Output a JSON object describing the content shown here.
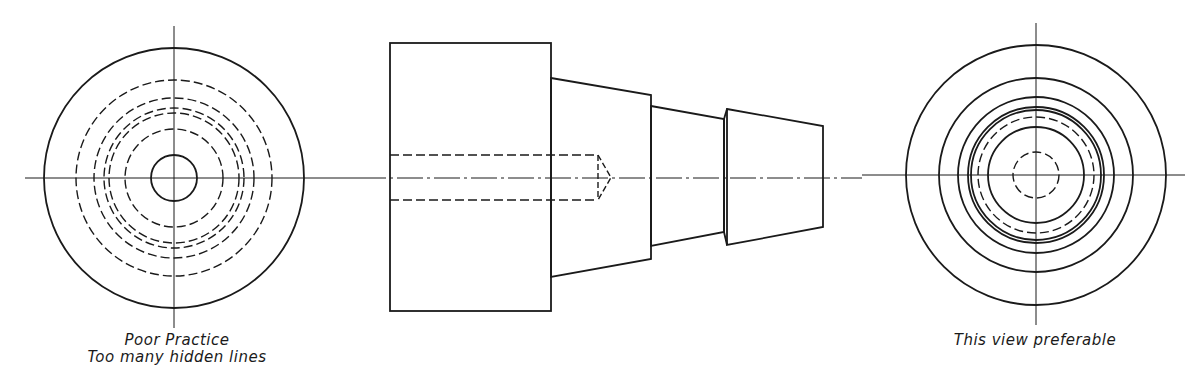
{
  "figure": {
    "colors": {
      "line": "#1a1a1a",
      "background": "#ffffff"
    },
    "views": [
      {
        "id": "left-end-view",
        "caption_lines": [
          "Poor Practice",
          "Too many hidden lines"
        ],
        "center": [
          174,
          178
        ],
        "solid_circles_r": [
          130,
          23
        ],
        "hidden_circles_r": [
          98,
          80,
          70,
          65,
          49
        ]
      },
      {
        "id": "front-view",
        "caption_lines": [],
        "base_block": {
          "x1": 390,
          "y1": 43,
          "x2": 551,
          "y2": 311
        },
        "cone_sections": [
          {
            "x1": 551,
            "x2": 651,
            "top1": 78,
            "top2": 95,
            "bot1": 277,
            "bot2": 259
          },
          {
            "x1": 651,
            "x2": 724,
            "top1": 106,
            "top2": 119,
            "bot1": 246,
            "bot2": 232
          },
          {
            "x1": 727,
            "x2": 823,
            "top1": 109,
            "top2": 126,
            "bot1": 245,
            "bot2": 227
          }
        ],
        "hidden_bore": {
          "x1": 390,
          "x2": 598,
          "y1": 155,
          "y2": 200,
          "tip_x": 611
        }
      },
      {
        "id": "right-end-view",
        "caption_lines": [
          "This view preferable"
        ],
        "center": [
          1036,
          175
        ],
        "solid_circles_r": [
          130,
          97,
          78,
          68,
          65,
          48
        ],
        "hidden_circles_r": [
          58,
          23
        ]
      }
    ]
  }
}
